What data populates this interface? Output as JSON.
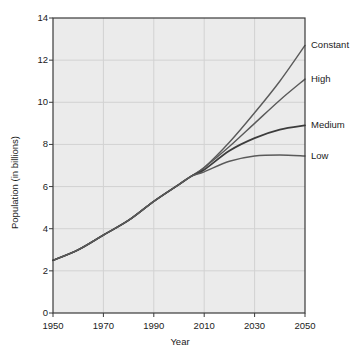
{
  "chart_data": {
    "type": "line",
    "title": "",
    "xlabel": "Year",
    "ylabel": "Population (in billions)",
    "xlim": [
      1950,
      2050
    ],
    "ylim": [
      0,
      14
    ],
    "xticks": [
      1950,
      1970,
      1990,
      2010,
      2030,
      2050
    ],
    "yticks": [
      0,
      2,
      4,
      6,
      8,
      10,
      12,
      14
    ],
    "xtick_labels": [
      "1950",
      "1970",
      "1990",
      "2010",
      "2030",
      "2050"
    ],
    "ytick_labels": [
      "0",
      "2",
      "4",
      "6",
      "8",
      "10",
      "12",
      "14"
    ],
    "grid": true,
    "legend_position": "right-of-axes-inline-labels",
    "x": [
      1950,
      1960,
      1970,
      1980,
      1990,
      2000,
      2005,
      2010,
      2020,
      2030,
      2040,
      2050
    ],
    "series": [
      {
        "name": "Constant",
        "label": "Constant",
        "color": "#5a5a5a",
        "values": [
          2.5,
          3.0,
          3.7,
          4.4,
          5.3,
          6.1,
          6.5,
          6.9,
          8.1,
          9.5,
          11.0,
          12.7
        ]
      },
      {
        "name": "High",
        "label": "High",
        "color": "#5a5a5a",
        "values": [
          2.5,
          3.0,
          3.7,
          4.4,
          5.3,
          6.1,
          6.5,
          6.9,
          7.9,
          9.0,
          10.1,
          11.1
        ]
      },
      {
        "name": "Medium",
        "label": "Medium",
        "color": "#3c3c3c",
        "values": [
          2.5,
          3.0,
          3.7,
          4.4,
          5.3,
          6.1,
          6.5,
          6.8,
          7.7,
          8.3,
          8.7,
          8.9
        ]
      },
      {
        "name": "Low",
        "label": "Low",
        "color": "#5a5a5a",
        "values": [
          2.5,
          3.0,
          3.7,
          4.4,
          5.3,
          6.1,
          6.5,
          6.7,
          7.2,
          7.45,
          7.5,
          7.45
        ]
      }
    ],
    "colors": {
      "plot_background": "#ebebeb",
      "grid": "#d2d2d2",
      "frame": "#3a3a3a",
      "text": "#1b1b1b",
      "line_light": "#5a5a5a",
      "line_dark": "#3c3c3c"
    }
  }
}
